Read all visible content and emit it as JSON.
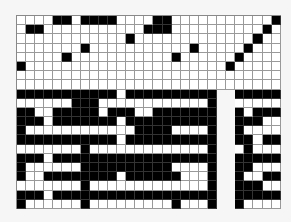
{
  "puzzle": {
    "cols": 29,
    "rows": 21,
    "cell_w": 9.1,
    "cell_h": 9.2,
    "colors": {
      "filled": "#000000",
      "empty": "#ffffff",
      "gap": "#f6f6f6",
      "line": "#999999"
    },
    "legend": "1 = black, 0 = white, 2 = gap",
    "grid": [
      "00001101111000011000000000001",
      "01100000000000111000000000010",
      "00000000000010000000000000100",
      "00000001000000000001000001000",
      "00000100000000000100000010000",
      "10000000000000000000000100000",
      "00000000000000000000000000000",
      "00000000000000000000000000000",
      "11111111111011111111112211111",
      "00000011100000000000012200000",
      "11001111101110011111112210111",
      "11101111111011111111112211100",
      "10000000000001111000012210000",
      "11111111111011111111112211011",
      "00000001000000000000012201000",
      "11101111111111111111112211111",
      "10000001111111111000012211000",
      "10011111111011111100012210011",
      "00000001000000000000012211100",
      "11101111111111111111112211111",
      "10000001000000000100012210000"
    ]
  }
}
